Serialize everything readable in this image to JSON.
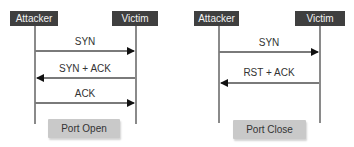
{
  "diagrams": [
    {
      "title": "Open port handshake",
      "actors": {
        "left": "Attacker",
        "right": "Victim"
      },
      "messages": [
        {
          "label": "SYN",
          "direction": "right"
        },
        {
          "label": "SYN + ACK",
          "direction": "left"
        },
        {
          "label": "ACK",
          "direction": "right"
        }
      ],
      "result": "Port Open"
    },
    {
      "title": "Closed port handshake",
      "actors": {
        "left": "Attacker",
        "right": "Victim"
      },
      "messages": [
        {
          "label": "SYN",
          "direction": "right"
        },
        {
          "label": "RST + ACK",
          "direction": "left"
        }
      ],
      "result": "Port Close"
    }
  ],
  "colors": {
    "actor_bg": "#3f3f3f",
    "actor_text": "#f2f2f2",
    "lifeline": "#8a8a8a",
    "arrowhead": "#111111",
    "result_bg": "#c9c9c9"
  }
}
